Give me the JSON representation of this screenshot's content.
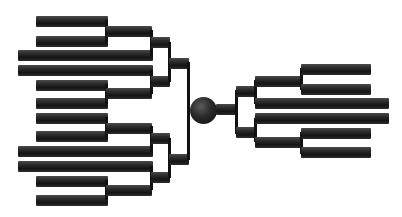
{
  "diagram": {
    "type": "dendrogram",
    "colors": {
      "branch": "#1a1a1a",
      "background": "#ffffff"
    },
    "root": {
      "shape": "circle",
      "cx": 203,
      "cy": 110,
      "r": 13
    },
    "left_leaves": 12,
    "right_leaves": 6
  }
}
